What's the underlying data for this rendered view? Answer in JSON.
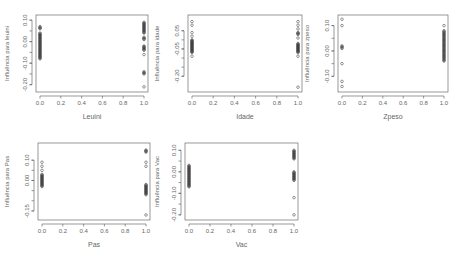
{
  "figure": {
    "layout": "2x3 grid of R scatter plots (5 panels)",
    "point_style": "open circle",
    "point_color": "#333333",
    "axis_color": "#555555"
  },
  "chart_data": [
    {
      "type": "scatter",
      "title": "",
      "xlabel": "Leuini",
      "ylabel": "Influência para leuini",
      "xlim": [
        0.0,
        1.0
      ],
      "ylim": [
        -0.22,
        0.11
      ],
      "xticks": [
        "0.0",
        "0.2",
        "0.4",
        "0.6",
        "0.8",
        "1.0"
      ],
      "yticks": [
        "0.10",
        "0.00",
        "-0.10",
        "-0.20"
      ],
      "ytick_values": [
        0.1,
        0.0,
        -0.1,
        -0.2
      ],
      "grid": false,
      "points": {
        "x0": [
          0.07,
          0.06,
          0.04,
          0.03,
          0.02,
          0.01,
          0.0,
          -0.01,
          -0.02,
          -0.03,
          -0.04,
          -0.05,
          -0.06,
          -0.07,
          -0.08
        ],
        "x1": [
          0.09,
          0.08,
          0.07,
          0.06,
          0.05,
          0.04,
          0.02,
          0.01,
          -0.02,
          -0.03,
          -0.04,
          -0.06,
          -0.14,
          -0.15,
          -0.21
        ]
      }
    },
    {
      "type": "scatter",
      "title": "",
      "xlabel": "Idade",
      "ylabel": "Influência para idade",
      "xlim": [
        0.0,
        1.0
      ],
      "ylim": [
        -0.27,
        0.12
      ],
      "xticks": [
        "0.0",
        "0.2",
        "0.4",
        "0.6",
        "0.8",
        "1.0"
      ],
      "yticks": [
        "0.05",
        "-0.05",
        "-0.20"
      ],
      "ytick_values": [
        0.05,
        -0.05,
        -0.2
      ],
      "grid": false,
      "points": {
        "x0": [
          0.1,
          0.08,
          0.04,
          0.02,
          0.0,
          -0.01,
          -0.02,
          -0.03,
          -0.04,
          -0.05,
          -0.06,
          -0.07,
          -0.09
        ],
        "x1": [
          0.1,
          0.08,
          0.06,
          0.04,
          0.03,
          0.01,
          -0.02,
          -0.03,
          -0.04,
          -0.05,
          -0.06,
          -0.07,
          -0.09,
          -0.26
        ]
      }
    },
    {
      "type": "scatter",
      "title": "",
      "xlabel": "Zpeso",
      "ylabel": "Influência para zpeso",
      "xlim": [
        0.0,
        1.0
      ],
      "ylim": [
        -0.15,
        0.13
      ],
      "xticks": [
        "0.0",
        "0.2",
        "0.4",
        "0.6",
        "0.8",
        "1.0"
      ],
      "yticks": [
        "0.10",
        "0.00",
        "-0.10"
      ],
      "ytick_values": [
        0.1,
        0.0,
        -0.1
      ],
      "grid": false,
      "points": {
        "x0": [
          0.125,
          0.1,
          0.02,
          0.01,
          -0.05,
          -0.12,
          -0.14
        ],
        "x1": [
          0.1,
          0.08,
          0.07,
          0.06,
          0.05,
          0.04,
          0.03,
          0.02,
          0.01,
          0.0,
          -0.01,
          -0.02,
          -0.03,
          -0.04
        ]
      }
    },
    {
      "type": "scatter",
      "title": "",
      "xlabel": "Pas",
      "ylabel": "Influência para Pas",
      "xlim": [
        0.0,
        1.0
      ],
      "ylim": [
        -0.18,
        0.17
      ],
      "xticks": [
        "0.0",
        "0.2",
        "0.4",
        "0.6",
        "0.8",
        "1.0"
      ],
      "yticks": [
        "0.10",
        "0.00",
        "-0.15"
      ],
      "ytick_values": [
        0.1,
        0.0,
        -0.15
      ],
      "grid": false,
      "points": {
        "x0": [
          0.09,
          0.07,
          0.05,
          0.03,
          0.02,
          0.01,
          0.0,
          -0.01,
          -0.02,
          -0.03
        ],
        "x1": [
          0.15,
          0.14,
          0.09,
          0.07,
          -0.02,
          -0.03,
          -0.04,
          -0.05,
          -0.06,
          -0.07,
          -0.17
        ]
      }
    },
    {
      "type": "scatter",
      "title": "",
      "xlabel": "Vac",
      "ylabel": "Influência para Vac",
      "xlim": [
        0.0,
        1.0
      ],
      "ylim": [
        -0.21,
        0.12
      ],
      "xticks": [
        "0.0",
        "0.2",
        "0.4",
        "0.6",
        "0.8",
        "1.0"
      ],
      "yticks": [
        "0.10",
        "0.00",
        "-0.10",
        "-0.20"
      ],
      "ytick_values": [
        0.1,
        0.0,
        -0.1,
        -0.2
      ],
      "grid": false,
      "points": {
        "x0": [
          0.03,
          0.02,
          0.01,
          0.0,
          -0.01,
          -0.02,
          -0.03,
          -0.04,
          -0.05,
          -0.06,
          -0.07
        ],
        "x1": [
          0.1,
          0.09,
          0.08,
          0.07,
          0.06,
          0.0,
          -0.01,
          -0.02,
          -0.03,
          -0.04,
          -0.12,
          -0.2
        ]
      }
    }
  ]
}
